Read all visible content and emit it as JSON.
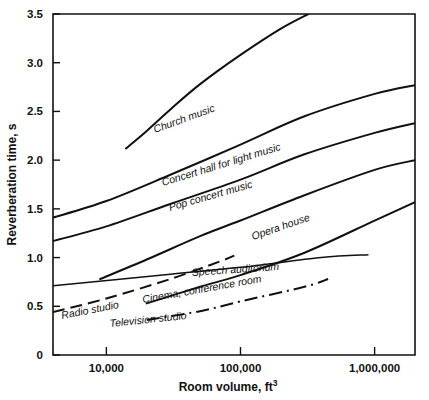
{
  "chart_data": {
    "type": "line",
    "title": "",
    "xlabel": "Room volume, ft",
    "xlabel_sup": "3",
    "ylabel": "Reverberation time, s",
    "xscale": "log",
    "xlim": [
      4000,
      2000000
    ],
    "ylim": [
      0,
      3.5
    ],
    "xticks": [
      10000,
      100000,
      1000000
    ],
    "xticklabels": [
      "10,000",
      "100,000",
      "1,000,000"
    ],
    "yticks": [
      0,
      0.5,
      1.0,
      1.5,
      2.0,
      2.5,
      3.0,
      3.5
    ],
    "yticklabels": [
      "0",
      "0.5",
      "1.0",
      "1.5",
      "2.0",
      "2.5",
      "3.0",
      "3.5"
    ],
    "grid": false,
    "legend": "inline-labels",
    "series": [
      {
        "name": "Church music",
        "label": "Church music",
        "style": "solid",
        "points": [
          [
            14000,
            2.12
          ],
          [
            20000,
            2.3
          ],
          [
            30000,
            2.52
          ],
          [
            50000,
            2.78
          ],
          [
            100000,
            3.08
          ],
          [
            200000,
            3.35
          ],
          [
            320000,
            3.5
          ]
        ]
      },
      {
        "name": "Concert hall for light music",
        "label": "Concert hall for light music",
        "style": "solid",
        "points": [
          [
            4000,
            1.41
          ],
          [
            10000,
            1.58
          ],
          [
            30000,
            1.85
          ],
          [
            100000,
            2.16
          ],
          [
            300000,
            2.45
          ],
          [
            1000000,
            2.68
          ],
          [
            2000000,
            2.77
          ]
        ]
      },
      {
        "name": "Pop concert music",
        "label": "Pop concert music",
        "style": "solid",
        "points": [
          [
            4000,
            1.17
          ],
          [
            10000,
            1.32
          ],
          [
            30000,
            1.55
          ],
          [
            100000,
            1.8
          ],
          [
            300000,
            2.06
          ],
          [
            1000000,
            2.28
          ],
          [
            2000000,
            2.38
          ]
        ]
      },
      {
        "name": "Opera house",
        "label": "Opera house",
        "style": "solid",
        "points": [
          [
            9000,
            0.78
          ],
          [
            20000,
            0.98
          ],
          [
            50000,
            1.22
          ],
          [
            100000,
            1.38
          ],
          [
            300000,
            1.64
          ],
          [
            1000000,
            1.9
          ],
          [
            2000000,
            2.0
          ]
        ]
      },
      {
        "name": "Speech auditorium",
        "label": "Speech auditorium",
        "style": "solid-thin",
        "points": [
          [
            4000,
            0.71
          ],
          [
            30000,
            0.83
          ],
          [
            100000,
            0.9
          ],
          [
            400000,
            1.0
          ],
          [
            900000,
            1.03
          ]
        ]
      },
      {
        "name": "Cinema, conference room",
        "label": "Cinema, conference room",
        "style": "solid",
        "points": [
          [
            20000,
            0.53
          ],
          [
            50000,
            0.7
          ],
          [
            100000,
            0.82
          ],
          [
            300000,
            1.05
          ],
          [
            1000000,
            1.38
          ],
          [
            2000000,
            1.57
          ]
        ]
      },
      {
        "name": "Radio studio",
        "label": "Radio studio",
        "style": "dashed",
        "points": [
          [
            4000,
            0.44
          ],
          [
            10000,
            0.58
          ],
          [
            30000,
            0.78
          ],
          [
            70000,
            0.96
          ],
          [
            90000,
            1.02
          ]
        ]
      },
      {
        "name": "Television studio",
        "label": "Television studio",
        "style": "dash-dot",
        "points": [
          [
            20000,
            0.36
          ],
          [
            50000,
            0.45
          ],
          [
            100000,
            0.55
          ],
          [
            300000,
            0.7
          ],
          [
            450000,
            0.78
          ]
        ]
      }
    ]
  },
  "colors": {
    "ink": "#111111",
    "paper": "#ffffff"
  }
}
